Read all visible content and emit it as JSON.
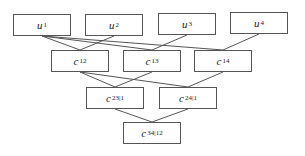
{
  "diagram": {
    "type": "vine-tree",
    "levels": [
      {
        "level": 0,
        "nodes": [
          {
            "id": "u1",
            "var": "u",
            "sub": "1",
            "x": 13,
            "y": 14,
            "w": 58,
            "h": 22
          },
          {
            "id": "u2",
            "var": "u",
            "sub": "2",
            "x": 85,
            "y": 14,
            "w": 58,
            "h": 22
          },
          {
            "id": "u3",
            "var": "u",
            "sub": "3",
            "x": 158,
            "y": 13,
            "w": 58,
            "h": 22
          },
          {
            "id": "u4",
            "var": "u",
            "sub": "4",
            "x": 230,
            "y": 12,
            "w": 58,
            "h": 22
          }
        ]
      },
      {
        "level": 1,
        "nodes": [
          {
            "id": "c12",
            "var": "c",
            "sub": "12",
            "x": 51,
            "y": 50,
            "w": 58,
            "h": 22
          },
          {
            "id": "c13",
            "var": "c",
            "sub": "13",
            "x": 123,
            "y": 50,
            "w": 58,
            "h": 22
          },
          {
            "id": "c14",
            "var": "c",
            "sub": "14",
            "x": 194,
            "y": 50,
            "w": 58,
            "h": 22
          }
        ]
      },
      {
        "level": 2,
        "nodes": [
          {
            "id": "c23_1",
            "var": "c",
            "sub": "23|1",
            "x": 86,
            "y": 87,
            "w": 58,
            "h": 22
          },
          {
            "id": "c24_1",
            "var": "c",
            "sub": "24|1",
            "x": 159,
            "y": 87,
            "w": 58,
            "h": 22
          }
        ]
      },
      {
        "level": 3,
        "nodes": [
          {
            "id": "c34_12",
            "var": "c",
            "sub": "34|12",
            "x": 123,
            "y": 122,
            "w": 58,
            "h": 22
          }
        ]
      }
    ],
    "edges": [
      {
        "from": "u1",
        "to": "c12"
      },
      {
        "from": "u2",
        "to": "c12"
      },
      {
        "from": "u1",
        "to": "c13"
      },
      {
        "from": "u3",
        "to": "c13"
      },
      {
        "from": "u1",
        "to": "c14"
      },
      {
        "from": "u4",
        "to": "c14"
      },
      {
        "from": "c12",
        "to": "c23_1"
      },
      {
        "from": "c13",
        "to": "c23_1"
      },
      {
        "from": "c12",
        "to": "c24_1"
      },
      {
        "from": "c14",
        "to": "c24_1"
      },
      {
        "from": "c23_1",
        "to": "c34_12"
      },
      {
        "from": "c24_1",
        "to": "c34_12"
      }
    ],
    "colors": {
      "line": "#555555",
      "box_border": "#555555",
      "text": "#222222",
      "background": "#ffffff"
    }
  },
  "labels": {
    "u1": {
      "var": "u",
      "sub": "1"
    },
    "u2": {
      "var": "u",
      "sub": "2"
    },
    "u3": {
      "var": "u",
      "sub": "3"
    },
    "u4": {
      "var": "u",
      "sub": "4"
    },
    "c12": {
      "var": "c",
      "sub": "12"
    },
    "c13": {
      "var": "c",
      "sub": "13"
    },
    "c14": {
      "var": "c",
      "sub": "14"
    },
    "c23_1": {
      "var": "c",
      "sub": "23|1"
    },
    "c24_1": {
      "var": "c",
      "sub": "24|1"
    },
    "c34_12": {
      "var": "c",
      "sub": "34|12"
    }
  }
}
